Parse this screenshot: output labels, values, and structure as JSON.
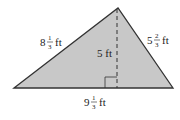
{
  "diagram": {
    "type": "triangle",
    "fill_color": "#c8c8c8",
    "stroke_color": "#333333",
    "labels": {
      "left_side": {
        "whole": "8",
        "num": "1",
        "den": "3",
        "unit": "ft"
      },
      "right_side": {
        "whole": "5",
        "num": "2",
        "den": "3",
        "unit": "ft"
      },
      "base": {
        "whole": "9",
        "num": "1",
        "den": "3",
        "unit": "ft"
      },
      "height": "5 ft"
    }
  }
}
